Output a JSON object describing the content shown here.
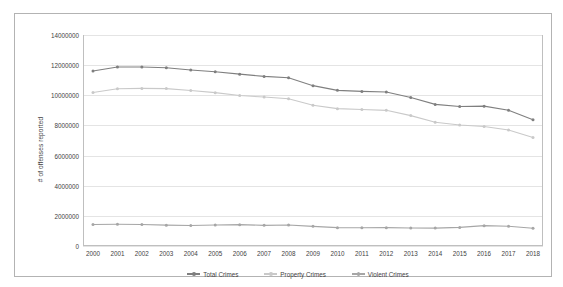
{
  "chart_data": {
    "type": "line",
    "title": "",
    "xlabel": "",
    "ylabel": "# of offenses reported",
    "ylim": [
      0,
      14000000
    ],
    "ytick_step": 2000000,
    "grid": true,
    "legend_position": "bottom",
    "categories": [
      "2000",
      "2001",
      "2002",
      "2003",
      "2004",
      "2005",
      "2006",
      "2007",
      "2008",
      "2009",
      "2010",
      "2011",
      "2012",
      "2013",
      "2014",
      "2015",
      "2016",
      "2017",
      "2018"
    ],
    "yticks": [
      "0",
      "2000000",
      "4000000",
      "6000000",
      "8000000",
      "10000000",
      "12000000",
      "14000000"
    ],
    "series": [
      {
        "name": "Total Crimes",
        "color": "#7f7f7f",
        "values": [
          11608072,
          11876669,
          11878954,
          11826538,
          11679474,
          11565499,
          11401511,
          11251828,
          11160543,
          10639369,
          10329135,
          10258774,
          10219059,
          9850445,
          9395195,
          9258298,
          9280087,
          9006705,
          8373657
        ]
      },
      {
        "name": "Property Crimes",
        "color": "#c9c9c9",
        "values": [
          10182584,
          10437480,
          10455277,
          10442862,
          10319386,
          10174754,
          9983568,
          9882212,
          9767915,
          9337060,
          9112625,
          9052743,
          9001992,
          8651892,
          8209010,
          8024115,
          7928530,
          7694086,
          7196045
        ]
      },
      {
        "name": "Violent Crimes",
        "color": "#a6a6a6",
        "values": [
          1425486,
          1439480,
          1423677,
          1383676,
          1360088,
          1390745,
          1417943,
          1369616,
          1392628,
          1302317,
          1216510,
          1206031,
          1217057,
          1198561,
          1186185,
          1234183,
          1351588,
          1312619,
          1177625
        ]
      }
    ]
  }
}
